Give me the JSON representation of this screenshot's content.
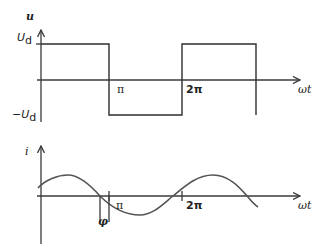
{
  "upper_plot": {
    "y_axis_label": "u",
    "level_high_label": "U",
    "level_high_sub": "d",
    "level_low_label": "−U",
    "level_low_sub": "d",
    "tick_pi": "π",
    "tick_2pi": "2π",
    "x_axis_label": "ωt",
    "waveform": "square",
    "segments": [
      {
        "from": "0",
        "to": "π",
        "value": "U_d"
      },
      {
        "from": "π",
        "to": "2π",
        "value": "−U_d"
      },
      {
        "from": "2π",
        "to": "3π",
        "value": "U_d"
      }
    ]
  },
  "lower_plot": {
    "y_axis_label": "i",
    "tick_pi": "π",
    "tick_2pi": "2π",
    "x_axis_label": "ωt",
    "phase_label": "φ",
    "waveform": "sine lagging by φ"
  },
  "colors": {
    "line": "#3a3a3a",
    "sine": "#555555",
    "background": "#ffffff"
  }
}
